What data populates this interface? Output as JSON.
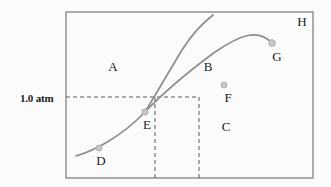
{
  "figure": {
    "type": "phase-diagram",
    "background_color": "#fbfbfb",
    "frame": {
      "x": 66,
      "y": 12,
      "width": 247,
      "height": 166,
      "stroke_color": "#8a8a8a",
      "stroke_width": 1.4
    },
    "curve_color": "#8f8d8e",
    "marker_color": "#c9c7c6",
    "marker_edge_color": "#a9a7a6",
    "dash_color": "#5a5a5a"
  },
  "pressure_axis": {
    "tick_label": "1.0 atm",
    "tick_label_x": 20,
    "tick_label_y": 92,
    "gridline_y": 97,
    "gridline_x_start": 66,
    "gridline_x_end": 199
  },
  "temperature_gridlines": [
    {
      "name": "melting-point-gridline",
      "x": 155,
      "y_top": 97,
      "y_bottom": 178
    },
    {
      "name": "boiling-point-gridline",
      "x": 199,
      "y_top": 97,
      "y_bottom": 178
    }
  ],
  "curves": [
    {
      "name": "vaporization-curve",
      "path": "M 76 156 C 96 150, 122 136, 145 112 C 168 88, 196 66, 215 52 C 240 35, 258 28, 272 43",
      "description": "lower liquid-gas boundary through D, E, F to G"
    },
    {
      "name": "fusion-curve",
      "path": "M 145 112 C 156 94, 170 70, 182 50 C 192 34, 204 22, 213 15",
      "description": "steep solid-liquid boundary rising from triple point E"
    }
  ],
  "points": [
    {
      "id": "D",
      "label": "D",
      "marker_x": 99,
      "marker_y": 148,
      "label_x": 101,
      "label_y": 161,
      "radius": 3.0
    },
    {
      "id": "E",
      "label": "E",
      "marker_x": 145,
      "marker_y": 112,
      "label_x": 147,
      "label_y": 125,
      "radius": 3.2
    },
    {
      "id": "F",
      "label": "F",
      "marker_x": 224,
      "marker_y": 85,
      "label_x": 228,
      "label_y": 98,
      "radius": 3.0
    },
    {
      "id": "G",
      "label": "G",
      "marker_x": 272,
      "marker_y": 43,
      "label_x": 277,
      "label_y": 57,
      "radius": 3.4
    }
  ],
  "regions": [
    {
      "id": "A",
      "label": "A",
      "x": 113,
      "y": 67
    },
    {
      "id": "B",
      "label": "B",
      "x": 208,
      "y": 67
    },
    {
      "id": "C",
      "label": "C",
      "x": 226,
      "y": 127
    },
    {
      "id": "H",
      "label": "H",
      "x": 302,
      "y": 22
    }
  ]
}
